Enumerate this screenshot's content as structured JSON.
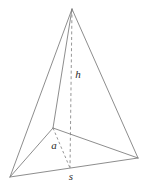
{
  "diagram": {
    "title": "Triangular pyramid with height, apothem and base side labeled",
    "shape": "triangular-pyramid",
    "background_color": "#ffffff",
    "edge_color": "#808080",
    "dashed_color": "#8a8a8a",
    "label_color": "#2b2b2b",
    "labels": {
      "height": "h",
      "apothem": "a",
      "side": "s"
    },
    "label_positions": {
      "height": {
        "x": 78,
        "y": 75
      },
      "apothem": {
        "x": 54,
        "y": 146
      },
      "side": {
        "x": 71,
        "y": 177
      }
    },
    "vertices": {
      "apex": {
        "x": 72,
        "y": 9
      },
      "base_back": {
        "x": 53,
        "y": 128
      },
      "base_left": {
        "x": 10,
        "y": 177
      },
      "base_right": {
        "x": 138,
        "y": 158
      },
      "base_center": {
        "x": 70,
        "y": 168
      }
    },
    "edges": [
      {
        "name": "apex-to-base-left",
        "from": "apex",
        "to": "base_left",
        "style": "solid"
      },
      {
        "name": "apex-to-base-right",
        "from": "apex",
        "to": "base_right",
        "style": "solid"
      },
      {
        "name": "apex-to-base-back",
        "from": "apex",
        "to": "base_back",
        "style": "solid"
      },
      {
        "name": "base-left-to-base-right",
        "from": "base_left",
        "to": "base_right",
        "style": "solid"
      },
      {
        "name": "base-back-to-base-left",
        "from": "base_back",
        "to": "base_left",
        "style": "solid"
      },
      {
        "name": "base-back-to-base-right",
        "from": "base_back",
        "to": "base_right",
        "style": "solid"
      },
      {
        "name": "height-line",
        "from": "apex",
        "to": "base_center",
        "style": "dashed"
      },
      {
        "name": "apothem-line",
        "from": "base_back",
        "to": "base_center",
        "style": "dashed"
      }
    ]
  }
}
